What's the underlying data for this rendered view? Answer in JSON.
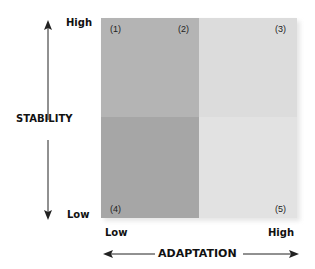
{
  "y_axis": {
    "title": "STABILITY",
    "high_label": "High",
    "low_label": "Low"
  },
  "x_axis": {
    "title": "ADAPTATION",
    "low_label": "Low",
    "high_label": "High"
  },
  "quadrants": {
    "top_left": {
      "color": "#b4b4b4"
    },
    "top_right": {
      "color": "#dcdcdc"
    },
    "bottom_left": {
      "color": "#a6a6a6"
    },
    "bottom_right": {
      "color": "#e2e2e2"
    }
  },
  "markers": [
    "(1)",
    "(2)",
    "(3)",
    "(4)",
    "(5)"
  ]
}
